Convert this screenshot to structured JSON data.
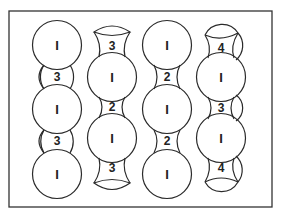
{
  "figure": {
    "frame": {
      "x": 9,
      "y": 11,
      "width": 263,
      "height": 196
    },
    "columns": [
      {
        "name": "column-1",
        "circles": [
          {
            "cx": 57,
            "cy": 45,
            "r": 24,
            "label": "I"
          },
          {
            "cx": 57,
            "cy": 109,
            "r": 24,
            "label": "I"
          },
          {
            "cx": 57,
            "cy": 174,
            "r": 24,
            "label": "I"
          }
        ],
        "gaps": [
          {
            "x": 57,
            "y": 76,
            "label": "3"
          },
          {
            "x": 57,
            "y": 141,
            "label": "3"
          }
        ]
      },
      {
        "name": "column-2",
        "circles": [
          {
            "cx": 112,
            "cy": 77,
            "r": 24,
            "label": "I"
          },
          {
            "cx": 112,
            "cy": 138,
            "r": 24,
            "label": "I"
          }
        ],
        "gaps": [
          {
            "x": 112,
            "y": 47,
            "label": "3"
          },
          {
            "x": 112,
            "y": 107,
            "label": "2"
          },
          {
            "x": 112,
            "y": 168,
            "label": "3"
          }
        ]
      },
      {
        "name": "column-3",
        "circles": [
          {
            "cx": 167,
            "cy": 45,
            "r": 24,
            "label": "I"
          },
          {
            "cx": 167,
            "cy": 109,
            "r": 24,
            "label": "I"
          },
          {
            "cx": 167,
            "cy": 174,
            "r": 24,
            "label": "I"
          }
        ],
        "gaps": [
          {
            "x": 167,
            "y": 77,
            "label": "2"
          },
          {
            "x": 167,
            "y": 141,
            "label": "2"
          }
        ]
      },
      {
        "name": "column-4",
        "circles": [
          {
            "cx": 221,
            "cy": 77,
            "r": 24,
            "label": "I"
          },
          {
            "cx": 221,
            "cy": 138,
            "r": 24,
            "label": "I"
          }
        ],
        "gaps": [
          {
            "x": 221,
            "y": 47,
            "label": "4"
          },
          {
            "x": 221,
            "y": 108,
            "label": "3"
          },
          {
            "x": 221,
            "y": 168,
            "label": "4"
          }
        ]
      }
    ],
    "labels": {
      "c1_1": "I",
      "c1_2": "I",
      "c1_3": "I",
      "c1_g1": "3",
      "c1_g2": "3",
      "c2_1": "I",
      "c2_2": "I",
      "c2_g0": "3",
      "c2_g1": "2",
      "c2_g2": "3",
      "c3_1": "I",
      "c3_2": "I",
      "c3_3": "I",
      "c3_g1": "2",
      "c3_g2": "2",
      "c4_1": "I",
      "c4_2": "I",
      "c4_g0": "4",
      "c4_g1": "3",
      "c4_g2": "4"
    }
  }
}
